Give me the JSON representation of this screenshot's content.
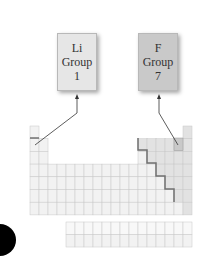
{
  "diagram": {
    "labels": [
      {
        "symbol": "Li",
        "group_word": "Group",
        "group_number": "1",
        "fill": "#e6e6e6"
      },
      {
        "symbol": "F",
        "group_word": "Group",
        "group_number": "7",
        "fill": "#c9c9c9"
      }
    ],
    "periodic_table": {
      "columns": 18,
      "main_rows": 7,
      "f_block_rows": 2,
      "f_block_columns": 14,
      "cell_fill": "#f2f2f2",
      "nonmetal_fill": "#e2e2e2",
      "highlight_fill": "#cfcfcf",
      "grid_line": "#c8c8c8",
      "staircase_color": "#707070"
    },
    "colors": {
      "arrow": "#333333",
      "dot": "#000000"
    }
  }
}
